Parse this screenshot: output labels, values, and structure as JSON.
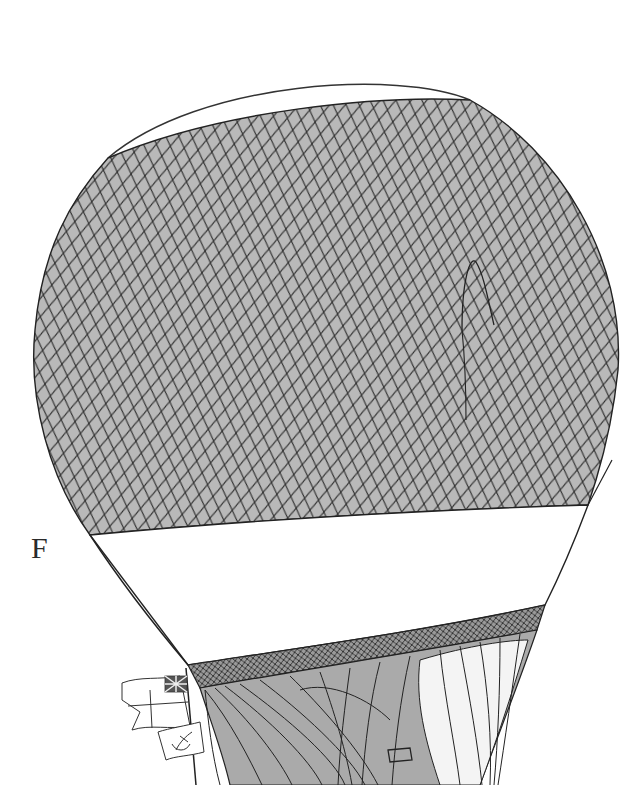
{
  "figure": {
    "label": "F",
    "colors": {
      "background": "#ffffff",
      "net_fill": "#b9b9b9",
      "net_line": "#2b2b2b",
      "band_fill": "#ffffff",
      "lower_fill": "#aaaaaa"
    },
    "flags": [
      {
        "name": "union-jack-ensign"
      },
      {
        "name": "anchor-pennant"
      }
    ]
  }
}
